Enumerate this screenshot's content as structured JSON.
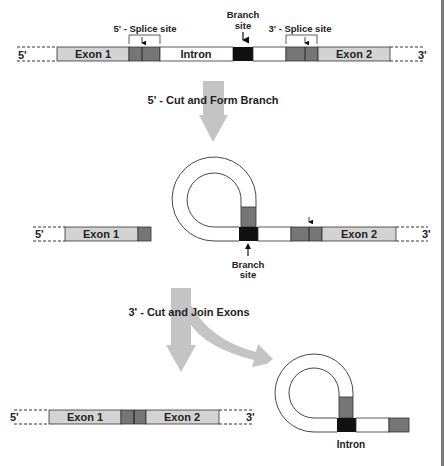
{
  "colors": {
    "exon": "#d3d3d3",
    "splice_site": "#767676",
    "branch_site": "#111111",
    "intron": "#ffffff",
    "arrow": "#c4c4c4",
    "outline": "#333333",
    "border": "#7a7a7a"
  },
  "stage1": {
    "five_prime": "5'",
    "three_prime": "3'",
    "exon1": "Exon 1",
    "intron": "Intron",
    "exon2": "Exon 2",
    "splice5_label": "5' - Splice site",
    "splice3_label": "3' - Splice site",
    "branch_label_line1": "Branch",
    "branch_label_line2": "site"
  },
  "step1": {
    "label": "5' - Cut and Form Branch"
  },
  "stage2": {
    "five_prime": "5'",
    "three_prime": "3'",
    "exon1": "Exon 1",
    "exon2": "Exon 2",
    "branch_label_line1": "Branch",
    "branch_label_line2": "site"
  },
  "step2": {
    "label": "3' - Cut and Join Exons"
  },
  "stage3": {
    "five_prime": "5'",
    "three_prime": "3'",
    "exon1": "Exon 1",
    "exon2": "Exon 2",
    "intron_label": "Intron"
  }
}
